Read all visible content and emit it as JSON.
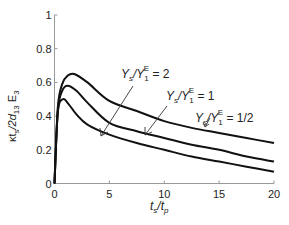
{
  "chart_data": {
    "type": "line",
    "title": "",
    "xlabel": "t_s/t_p",
    "ylabel": "κt_s/2d_13 E_3",
    "xlim": [
      0,
      20
    ],
    "ylim": [
      0,
      1
    ],
    "xticks": [
      0,
      5,
      10,
      15,
      20
    ],
    "yticks": [
      0,
      0.2,
      0.4,
      0.6,
      0.8,
      1
    ],
    "xtick_labels": [
      "0",
      "5",
      "10",
      "15",
      "20"
    ],
    "ytick_labels": [
      "0",
      "0.2",
      "0.4",
      "0.6",
      "0.8",
      "1"
    ],
    "grid": false,
    "legend": "inline annotations with arrows",
    "series": [
      {
        "name": "Ys/Y1E = 2",
        "x": [
          0,
          0.3,
          0.7,
          1.2,
          1.8,
          3,
          5,
          7.5,
          10,
          12.5,
          15,
          17.5,
          20
        ],
        "y": [
          0,
          0.45,
          0.59,
          0.64,
          0.65,
          0.6,
          0.49,
          0.43,
          0.37,
          0.33,
          0.3,
          0.27,
          0.24
        ]
      },
      {
        "name": "Ys/Y1E = 1",
        "x": [
          0,
          0.3,
          0.7,
          1.2,
          2,
          3,
          5,
          7.5,
          10,
          12.5,
          15,
          17.5,
          20
        ],
        "y": [
          0,
          0.43,
          0.55,
          0.58,
          0.55,
          0.48,
          0.36,
          0.31,
          0.27,
          0.23,
          0.2,
          0.16,
          0.13
        ]
      },
      {
        "name": "Ys/Y1E = 1/2",
        "x": [
          0,
          0.3,
          0.75,
          1.3,
          2,
          3,
          5,
          7.5,
          10,
          12.5,
          15,
          17.5,
          20
        ],
        "y": [
          0,
          0.42,
          0.5,
          0.47,
          0.41,
          0.35,
          0.29,
          0.24,
          0.2,
          0.16,
          0.13,
          0.1,
          0.07
        ]
      }
    ],
    "annotations": [
      {
        "text_main": "Y",
        "sub1": "s",
        "slash": "/Y",
        "sub2": "1",
        "sup": "E",
        "rhs": " = 2"
      },
      {
        "text_main": "Y",
        "sub1": "s",
        "slash": "/Y",
        "sub2": "1",
        "sup": "E",
        "rhs": " = 1"
      },
      {
        "text_main": "Y",
        "sub1": "s",
        "slash": "/Y",
        "sub2": "1",
        "sup": "E",
        "rhs": " = 1/2"
      }
    ]
  },
  "labels": {
    "x_main": "t",
    "x_sub1": "s",
    "x_slash": "/t",
    "x_sub2": "p",
    "y_kappa": "κt",
    "y_sub1": "s",
    "y_mid": "/2d",
    "y_sub2": "13",
    "y_E": " E",
    "y_sub3": "3"
  }
}
